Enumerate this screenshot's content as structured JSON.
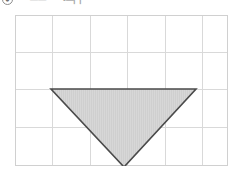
{
  "header": {
    "circle_icon_glyph": "●",
    "faint_text_1": "——",
    "faint_text_2": "•—▏▏"
  },
  "figure": {
    "caption": "",
    "grid": {
      "columns": 6,
      "rows": 4,
      "cell_width": 37.5,
      "cell_height": 37.5,
      "origin_x": 0,
      "origin_y": 0,
      "width": 213,
      "height": 151,
      "line_color": "#d9d9d9",
      "border_color": "#d0d0d0",
      "background": "#ffffff"
    },
    "shape": {
      "name": "inverted-triangle",
      "type": "polygon",
      "points": "36,74 181,74 109,152",
      "vertices": [
        {
          "label": "left",
          "x": 36,
          "y": 74
        },
        {
          "label": "right",
          "x": 181,
          "y": 74
        },
        {
          "label": "bottom",
          "x": 109,
          "y": 152
        }
      ],
      "fill_color": "#d7d7d7",
      "stroke_color": "#4a4a4a",
      "stroke_width": 1.6,
      "hatch_color": "#c9c9c9"
    }
  }
}
